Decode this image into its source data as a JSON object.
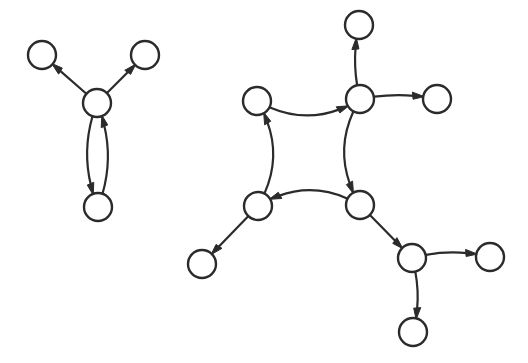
{
  "canvas": {
    "width": 528,
    "height": 363,
    "background_color": "#ffffff",
    "stroke_color": "#2b2b2b",
    "node_fill_color": "#ffffff",
    "node_radius": 14,
    "node_stroke_width": 2.4,
    "edge_stroke_width": 2.2,
    "arrowhead_length": 11,
    "arrowhead_width": 7
  },
  "graphs": [
    {
      "id": "left-graph",
      "name": "left-component",
      "node_count": 4,
      "edge_count": 4,
      "nodes": [
        {
          "id": "L1",
          "name": "left-upper-left-node",
          "cx": 42,
          "cy": 55,
          "r": 14
        },
        {
          "id": "L2",
          "name": "left-upper-right-node",
          "cx": 145,
          "cy": 55,
          "r": 14
        },
        {
          "id": "L3",
          "name": "left-center-node",
          "cx": 97,
          "cy": 103,
          "r": 14
        },
        {
          "id": "L4",
          "name": "left-bottom-node",
          "cx": 98,
          "cy": 207,
          "r": 14
        }
      ],
      "edges": [
        {
          "id": "LE1",
          "name": "edge-center-to-upper-left",
          "from": "L3",
          "to": "L1",
          "curvature": 0,
          "directed": true
        },
        {
          "id": "LE2",
          "name": "edge-center-to-upper-right",
          "from": "L3",
          "to": "L2",
          "curvature": 0,
          "directed": true
        },
        {
          "id": "LE3",
          "name": "edge-center-to-bottom",
          "from": "L3",
          "to": "L4",
          "curvature": 0.2,
          "directed": true
        },
        {
          "id": "LE4",
          "name": "edge-bottom-to-center",
          "from": "L4",
          "to": "L3",
          "curvature": 0.2,
          "directed": true
        }
      ]
    },
    {
      "id": "right-graph",
      "name": "right-component",
      "node_count": 9,
      "edge_count": 10,
      "nodes": [
        {
          "id": "R1",
          "name": "cycle-top-left-node",
          "cx": 257,
          "cy": 101,
          "r": 14
        },
        {
          "id": "R2",
          "name": "cycle-top-right-node",
          "cx": 360,
          "cy": 99,
          "r": 14
        },
        {
          "id": "R3",
          "name": "cycle-bottom-right-node",
          "cx": 360,
          "cy": 205,
          "r": 14
        },
        {
          "id": "R4",
          "name": "cycle-bottom-left-node",
          "cx": 258,
          "cy": 206,
          "r": 14
        },
        {
          "id": "R5",
          "name": "top-satellite-node",
          "cx": 359,
          "cy": 25,
          "r": 14
        },
        {
          "id": "R6",
          "name": "right-satellite-node",
          "cx": 437,
          "cy": 99,
          "r": 14
        },
        {
          "id": "R7",
          "name": "lower-left-satellite-node",
          "cx": 202,
          "cy": 264,
          "r": 14
        },
        {
          "id": "R8",
          "name": "bottom-hub-node",
          "cx": 412,
          "cy": 258,
          "r": 14
        },
        {
          "id": "R9",
          "name": "far-right-satellite-node",
          "cx": 490,
          "cy": 257,
          "r": 14
        },
        {
          "id": "R10",
          "name": "bottom-satellite-node",
          "cx": 413,
          "cy": 332,
          "r": 14
        }
      ],
      "edges": [
        {
          "id": "RE1",
          "name": "cycle-edge-bottom-left-to-top-left",
          "from": "R4",
          "to": "R1",
          "curvature": 0.3,
          "directed": true
        },
        {
          "id": "RE2",
          "name": "cycle-edge-top-left-to-top-right",
          "from": "R1",
          "to": "R2",
          "curvature": 0.3,
          "directed": true
        },
        {
          "id": "RE3",
          "name": "cycle-edge-top-right-to-bottom-right",
          "from": "R2",
          "to": "R3",
          "curvature": 0.3,
          "directed": true
        },
        {
          "id": "RE4",
          "name": "cycle-edge-bottom-right-to-bottom-left",
          "from": "R3",
          "to": "R4",
          "curvature": 0.3,
          "directed": true
        },
        {
          "id": "RE5",
          "name": "edge-top-right-to-top-satellite",
          "from": "R2",
          "to": "R5",
          "curvature": -0.12,
          "directed": true
        },
        {
          "id": "RE6",
          "name": "edge-top-right-to-right-satellite",
          "from": "R2",
          "to": "R6",
          "curvature": -0.1,
          "directed": true
        },
        {
          "id": "RE7",
          "name": "edge-bottom-left-to-lower-left-satellite",
          "from": "R4",
          "to": "R7",
          "curvature": 0,
          "directed": true
        },
        {
          "id": "RE8",
          "name": "edge-bottom-right-to-hub",
          "from": "R3",
          "to": "R8",
          "curvature": 0,
          "directed": true
        },
        {
          "id": "RE9",
          "name": "edge-hub-to-far-right-satellite",
          "from": "R8",
          "to": "R9",
          "curvature": -0.13,
          "directed": true
        },
        {
          "id": "RE10",
          "name": "edge-hub-to-bottom-satellite",
          "from": "R8",
          "to": "R10",
          "curvature": -0.14,
          "directed": true
        }
      ]
    }
  ]
}
